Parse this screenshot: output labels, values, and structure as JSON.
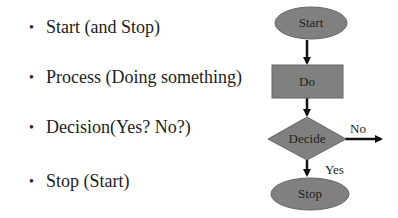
{
  "bullets": [
    {
      "text": "Start (and Stop)"
    },
    {
      "text": "Process (Doing something)"
    },
    {
      "text": "Decision(Yes? No?)"
    },
    {
      "text": "Stop (Start)"
    }
  ],
  "flowchart": {
    "fill_color": "#808080",
    "stroke_color": "#555555",
    "nodes": {
      "start": {
        "label": "Start",
        "shape": "ellipse"
      },
      "do": {
        "label": "Do",
        "shape": "rectangle"
      },
      "decide": {
        "label": "Decide",
        "shape": "diamond"
      },
      "stop": {
        "label": "Stop",
        "shape": "ellipse"
      }
    },
    "edges": {
      "no": {
        "label": "No"
      },
      "yes": {
        "label": "Yes"
      }
    }
  }
}
